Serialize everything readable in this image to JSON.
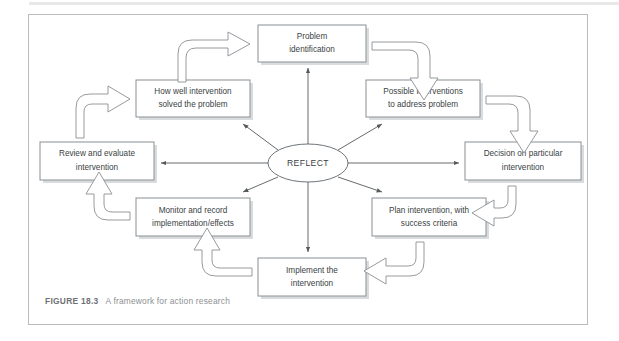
{
  "figure": {
    "caption_label": "FIGURE 18.3",
    "caption_text": "A framework for action research",
    "center_label": "REFLECT",
    "colors": {
      "frame_border": "#b9bdc0",
      "box_border": "#8a8f93",
      "box_shadow": "#d9dcde",
      "text": "#3a3f43",
      "caption": "#8d9093",
      "spoke": "#55595c",
      "background": "#ffffff"
    }
  },
  "diagram": {
    "type": "cycle-flowchart",
    "center": {
      "label": "REFLECT",
      "shape": "ellipse",
      "cx": 308,
      "cy": 163,
      "rx": 40,
      "ry": 19
    },
    "nodes": [
      {
        "id": "problem-identification",
        "line1": "Problem",
        "line2": "identification",
        "x": 258,
        "y": 25,
        "w": 108,
        "h": 37,
        "position": "top"
      },
      {
        "id": "possible-interventions",
        "line1": "Possible interventions",
        "line2": "to address problem",
        "x": 366,
        "y": 80,
        "w": 114,
        "h": 37,
        "position": "top-right"
      },
      {
        "id": "decision-on-particular-intervention",
        "line1": "Decision on particular",
        "line2": "intervention",
        "x": 465,
        "y": 142,
        "w": 116,
        "h": 38,
        "position": "right"
      },
      {
        "id": "plan-intervention",
        "line1": "Plan intervention, with",
        "line2": "success criteria",
        "x": 372,
        "y": 198,
        "w": 114,
        "h": 38,
        "position": "bottom-right"
      },
      {
        "id": "implement-the-intervention",
        "line1": "Implement the",
        "line2": "intervention",
        "x": 258,
        "y": 258,
        "w": 108,
        "h": 38,
        "position": "bottom"
      },
      {
        "id": "monitor-and-record",
        "line1": "Monitor and record",
        "line2": "implementation/effects",
        "x": 136,
        "y": 198,
        "w": 114,
        "h": 38,
        "position": "bottom-left"
      },
      {
        "id": "review-and-evaluate",
        "line1": "Review and evaluate",
        "line2": "intervention",
        "x": 40,
        "y": 142,
        "w": 114,
        "h": 38,
        "position": "left"
      },
      {
        "id": "how-well-intervention-solved",
        "line1": "How well intervention",
        "line2": "solved the problem",
        "x": 136,
        "y": 80,
        "w": 114,
        "h": 37,
        "position": "top-left"
      }
    ],
    "flow_arrows": [
      {
        "id": "arrow-problem-to-possible",
        "from": "problem-identification",
        "to": "possible-interventions",
        "style": "curved-block"
      },
      {
        "id": "arrow-possible-to-decision",
        "from": "possible-interventions",
        "to": "decision-on-particular-intervention",
        "style": "curved-block"
      },
      {
        "id": "arrow-decision-to-plan",
        "from": "decision-on-particular-intervention",
        "to": "plan-intervention",
        "style": "curved-block"
      },
      {
        "id": "arrow-plan-to-implement",
        "from": "plan-intervention",
        "to": "implement-the-intervention",
        "style": "curved-block"
      },
      {
        "id": "arrow-implement-to-monitor",
        "from": "implement-the-intervention",
        "to": "monitor-and-record",
        "style": "curved-block"
      },
      {
        "id": "arrow-monitor-to-review",
        "from": "monitor-and-record",
        "to": "review-and-evaluate",
        "style": "curved-block"
      },
      {
        "id": "arrow-review-to-howwell",
        "from": "review-and-evaluate",
        "to": "how-well-intervention-solved",
        "style": "curved-block"
      },
      {
        "id": "arrow-howwell-to-problem",
        "from": "how-well-intervention-solved",
        "to": "problem-identification",
        "style": "curved-block"
      }
    ],
    "spokes": [
      {
        "id": "spoke-to-problem-identification",
        "target": "problem-identification",
        "arrowhead": "end"
      },
      {
        "id": "spoke-to-possible-interventions",
        "target": "possible-interventions",
        "arrowhead": "end"
      },
      {
        "id": "spoke-to-decision",
        "target": "decision-on-particular-intervention",
        "arrowhead": "end"
      },
      {
        "id": "spoke-to-plan-intervention",
        "target": "plan-intervention",
        "arrowhead": "end"
      },
      {
        "id": "spoke-to-implement",
        "target": "implement-the-intervention",
        "arrowhead": "end"
      },
      {
        "id": "spoke-to-monitor",
        "target": "monitor-and-record",
        "arrowhead": "end"
      },
      {
        "id": "spoke-to-review",
        "target": "review-and-evaluate",
        "arrowhead": "end"
      },
      {
        "id": "spoke-to-how-well",
        "target": "how-well-intervention-solved",
        "arrowhead": "end"
      }
    ]
  }
}
